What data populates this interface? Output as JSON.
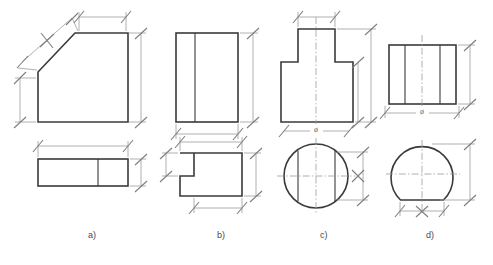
{
  "sheet": {
    "title": "Orthographic projection exercise sheet",
    "background": "#ffffff",
    "object_line_color": "#3a3a3a",
    "dimension_line_color": "#9a9a9a",
    "center_line_color": "#9a9a9a",
    "label_color": "#4a4a4a",
    "width": 493,
    "height": 265
  },
  "symbols": {
    "diameter": "ø"
  },
  "figures": [
    {
      "id": "a",
      "label": "a)",
      "label_x": 93,
      "label_y": 236,
      "front_view": {
        "name": "chamfered-block-front-view",
        "shape": "pentagon-with-chamfer",
        "description": "Rectangle with upper-left corner cut off by a diagonal chamfer"
      },
      "top_view": {
        "name": "chamfered-block-top-view",
        "shape": "rectangle-with-vertical-division",
        "description": "Rectangle divided by one vertical line near the right"
      },
      "dimensions": [
        "chamfer-length",
        "top-width",
        "right-height",
        "left-height",
        "plan-width",
        "plan-depth"
      ]
    },
    {
      "id": "b",
      "label": "b)",
      "label_x": 222,
      "label_y": 236,
      "front_view": {
        "name": "stepped-block-front-view",
        "shape": "rectangle-with-vertical-division",
        "description": "Rectangle divided by one vertical line near the left"
      },
      "top_view": {
        "name": "stepped-block-top-view",
        "shape": "l-shaped-notched-profile",
        "description": "Rectangle with a notch removed from the lower-left corner"
      },
      "dimensions": [
        "overall-width",
        "notch-height",
        "overall-height",
        "notch-width"
      ]
    },
    {
      "id": "c",
      "label": "c)",
      "label_x": 325,
      "label_y": 236,
      "front_view": {
        "name": "t-shaped-boss-front-view",
        "shape": "t-shaped-stepped-profile",
        "description": "Wide base with a narrower raised boss centred on top, vertical centre line"
      },
      "top_view": {
        "name": "t-shaped-boss-top-view",
        "shape": "circle-with-two-chords",
        "description": "Circle with two vertical chord lines and crossing centre lines"
      },
      "dimensions": [
        "boss-width",
        "overall-height",
        "boss-height",
        "diameter",
        "chord-spacing"
      ]
    },
    {
      "id": "d",
      "label": "d)",
      "label_x": 430,
      "label_y": 236,
      "front_view": {
        "name": "flat-cut-cylinder-front-view",
        "shape": "rectangle-with-two-vertical-divisions",
        "description": "Rectangle with two interior vertical lines and a dash-dot centre line"
      },
      "top_view": {
        "name": "flat-cut-cylinder-top-view",
        "shape": "circle-with-flat-bottom",
        "description": "Circle truncated by a flat chord across the bottom"
      },
      "dimensions": [
        "diameter",
        "height",
        "flat-width",
        "circle-height"
      ]
    }
  ]
}
